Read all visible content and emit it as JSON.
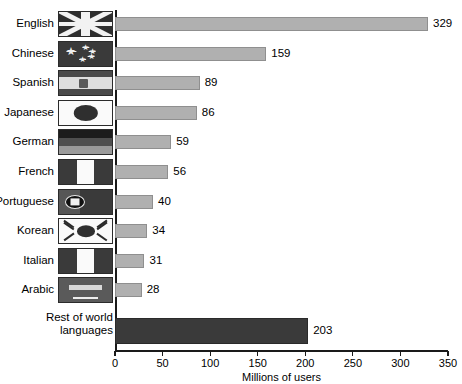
{
  "chart_data": {
    "type": "bar",
    "orientation": "horizontal",
    "title": "",
    "xlabel": "Millions of users",
    "ylabel": "",
    "xlim": [
      0,
      350
    ],
    "xticks": [
      0,
      50,
      100,
      150,
      200,
      250,
      300,
      350
    ],
    "grid": false,
    "legend": "none",
    "categories": [
      "English",
      "Chinese",
      "Spanish",
      "Japanese",
      "German",
      "French",
      "Portuguese",
      "Korean",
      "Italian",
      "Arabic",
      "Rest of world languages"
    ],
    "values": [
      329,
      159,
      89,
      86,
      59,
      56,
      40,
      34,
      31,
      28,
      203
    ],
    "series": [
      {
        "name": "Millions of users",
        "values": [
          329,
          159,
          89,
          86,
          59,
          56,
          40,
          34,
          31,
          28,
          203
        ]
      }
    ],
    "bar_colors": [
      "#b0b0b0",
      "#b0b0b0",
      "#b0b0b0",
      "#b0b0b0",
      "#b0b0b0",
      "#b0b0b0",
      "#b0b0b0",
      "#b0b0b0",
      "#b0b0b0",
      "#b0b0b0",
      "#3a3a3a"
    ],
    "annotations": [
      "329",
      "159",
      "89",
      "86",
      "59",
      "56",
      "40",
      "34",
      "31",
      "28",
      "203"
    ]
  },
  "rows": [
    {
      "label": "English",
      "value": 329,
      "value_text": "329",
      "flag": "flag-united-kingdom",
      "has_flag": true,
      "dark": false
    },
    {
      "label": "Chinese",
      "value": 159,
      "value_text": "159",
      "flag": "flag-china",
      "has_flag": true,
      "dark": false
    },
    {
      "label": "Spanish",
      "value": 89,
      "value_text": "89",
      "flag": "flag-spain",
      "has_flag": true,
      "dark": false
    },
    {
      "label": "Japanese",
      "value": 86,
      "value_text": "86",
      "flag": "flag-japan",
      "has_flag": true,
      "dark": false
    },
    {
      "label": "German",
      "value": 59,
      "value_text": "59",
      "flag": "flag-germany",
      "has_flag": true,
      "dark": false
    },
    {
      "label": "French",
      "value": 56,
      "value_text": "56",
      "flag": "flag-france",
      "has_flag": true,
      "dark": false
    },
    {
      "label": "Portuguese",
      "value": 40,
      "value_text": "40",
      "flag": "flag-portugal",
      "has_flag": true,
      "dark": false
    },
    {
      "label": "Korean",
      "value": 34,
      "value_text": "34",
      "flag": "flag-south-korea",
      "has_flag": true,
      "dark": false
    },
    {
      "label": "Italian",
      "value": 31,
      "value_text": "31",
      "flag": "flag-italy",
      "has_flag": true,
      "dark": false
    },
    {
      "label": "Arabic",
      "value": 28,
      "value_text": "28",
      "flag": "flag-arabic",
      "has_flag": true,
      "dark": false
    },
    {
      "label": "Rest of world languages",
      "value": 203,
      "value_text": "203",
      "flag": "",
      "has_flag": false,
      "dark": true
    }
  ],
  "axis": {
    "xlabel": "Millions of users",
    "ticks": [
      "0",
      "50",
      "100",
      "150",
      "200",
      "250",
      "300",
      "350"
    ]
  },
  "colors": {
    "bar": "#b0b0b0",
    "bar_dark": "#3a3a3a",
    "axis": "#1a1a1a",
    "text": "#000000",
    "background": "#ffffff"
  }
}
